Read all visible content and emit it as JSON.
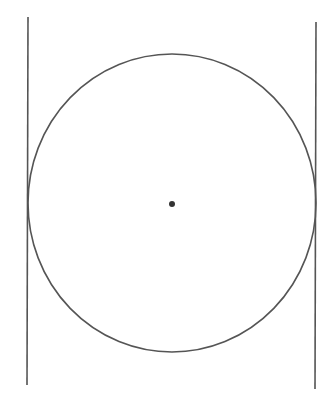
{
  "diagram": {
    "type": "circle-with-tangent-lines",
    "stroke_color": "#555555",
    "center_dot_color": "#333333",
    "circle": {
      "cx": 172,
      "cy": 203,
      "rx": 144,
      "ry": 149
    },
    "center_point": {
      "x": 172,
      "y": 204,
      "r": 3
    },
    "tangent_lines": [
      {
        "name": "left",
        "x1": 28,
        "y1": 17,
        "x2": 27,
        "y2": 385
      },
      {
        "name": "right",
        "x1": 316,
        "y1": 22,
        "x2": 315,
        "y2": 389
      }
    ]
  }
}
